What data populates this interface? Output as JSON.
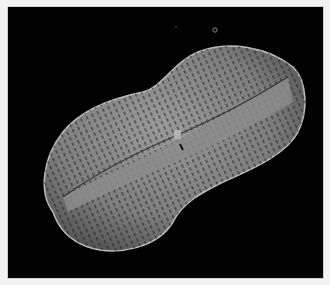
{
  "image": {
    "subject": "diatom SEM micrograph",
    "background_color": "#020202",
    "border_color": "#f2f2f2",
    "specimen_color": "#8a8a8a"
  }
}
